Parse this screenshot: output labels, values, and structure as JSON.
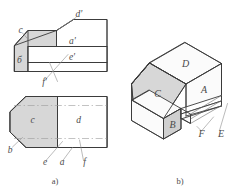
{
  "figure": {
    "captions": {
      "left": "a)",
      "right": "b)"
    },
    "views": {
      "front_view": {
        "name": "front view (upper orthographic projection)",
        "labels": {
          "c_prime": "c",
          "b_prime": "б",
          "d_prime": "d'",
          "a_prime": "a'",
          "e_prime": "e'",
          "f_prime": "f'"
        }
      },
      "top_view": {
        "name": "top view (lower orthographic projection)",
        "labels": {
          "c": "c",
          "d": "d",
          "b": "b",
          "e": "e",
          "a": "a",
          "f": "f"
        }
      },
      "pictorial_view": {
        "name": "isometric pictorial view",
        "labels": {
          "d": "D",
          "c": "C",
          "a": "A",
          "b": "B",
          "f": "F",
          "e": "E"
        }
      }
    },
    "colors": {
      "outline": "#3a3a3a",
      "shaded_face": "#d7d7d7",
      "light_face": "#fbfbfb",
      "leader": "#8d8d8d",
      "text": "#4a4a4a",
      "background": "#ffffff"
    }
  }
}
